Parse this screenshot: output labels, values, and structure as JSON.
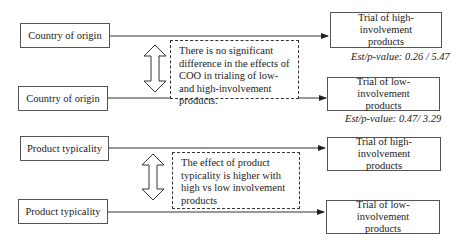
{
  "panels": [
    {
      "predictor_top": "Country of origin",
      "predictor_bottom": "Country of origin",
      "outcome_top": "Trial of high-involvement products",
      "outcome_bottom": "Trial of low-involvement products",
      "note": "There is no significant difference in the effects of COO in trialing of low- and high-involvement products.",
      "est_top": "Est/p-value: 0.26 / 5.47",
      "est_bottom": "Est/p-value: 0.47/ 3.29"
    },
    {
      "predictor_top": "Product typicality",
      "predictor_bottom": "Product typicality",
      "outcome_top": "Trial of high-involvement products",
      "outcome_bottom": "Trial of low-involvement products",
      "note": "The effect of product typicality is higher with high vs low involvement products"
    }
  ],
  "icons": {
    "comparison": "double-headed-vertical-arrow",
    "connector": "right-arrow"
  },
  "colors": {
    "line": "#333333",
    "box_border": "#555555",
    "background": "#ffffff"
  }
}
